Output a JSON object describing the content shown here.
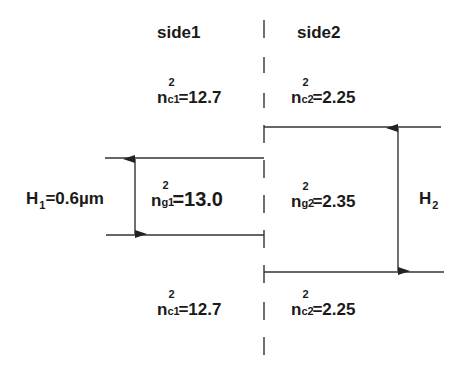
{
  "diagram": {
    "side_labels": {
      "left": "side1",
      "right": "side2"
    },
    "side1": {
      "cladding_top": {
        "symbol": "n",
        "sub": "c1",
        "sup": "2",
        "value": "=12.7"
      },
      "core": {
        "symbol": "n",
        "sub": "g1",
        "sup": "2",
        "value": "=13.0"
      },
      "cladding_bottom": {
        "symbol": "n",
        "sub": "c1",
        "sup": "2",
        "value": "=12.7"
      },
      "thickness": {
        "symbol": "H",
        "sub": "1",
        "value": "=0.6µm"
      }
    },
    "side2": {
      "cladding_top": {
        "symbol": "n",
        "sub": "c2",
        "sup": "2",
        "value": "=2.25"
      },
      "core": {
        "symbol": "n",
        "sub": "g2",
        "sup": "2",
        "value": "=2.35"
      },
      "cladding_bottom": {
        "symbol": "n",
        "sub": "c2",
        "sup": "2",
        "value": "=2.25"
      },
      "thickness": {
        "symbol": "H",
        "sub": "2",
        "value": ""
      }
    },
    "line_color": "#222222"
  }
}
